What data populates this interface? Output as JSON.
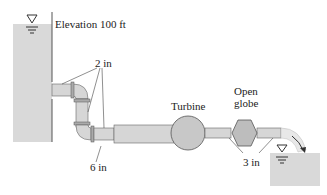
{
  "diagram": {
    "labels": {
      "elevation": "Elevation 100 ft",
      "pipe_small_upper": "2 in",
      "pipe_large": "6 in",
      "turbine": "Turbine",
      "valve_line1": "Open",
      "valve_line2": "globe",
      "pipe_exit": "3 in"
    },
    "components": [
      {
        "id": "upper-reservoir",
        "type": "reservoir",
        "water_surface_elevation_ft": 100
      },
      {
        "id": "pipe-2in",
        "type": "pipe",
        "diameter": "2 in",
        "fittings": [
          "elbow",
          "elbow"
        ]
      },
      {
        "id": "pipe-6in",
        "type": "pipe",
        "diameter": "6 in"
      },
      {
        "id": "turbine",
        "type": "turbine"
      },
      {
        "id": "pipe-3in",
        "type": "pipe",
        "diameter": "3 in"
      },
      {
        "id": "globe-valve",
        "type": "valve",
        "state": "Open globe"
      },
      {
        "id": "lower-reservoir",
        "type": "reservoir"
      }
    ],
    "colors": {
      "water": "#d9d9d9",
      "pipe": "#d6d6d6",
      "turbine": "#c8c8c8",
      "valve": "#bdbdbd",
      "stroke": "#555555"
    }
  }
}
